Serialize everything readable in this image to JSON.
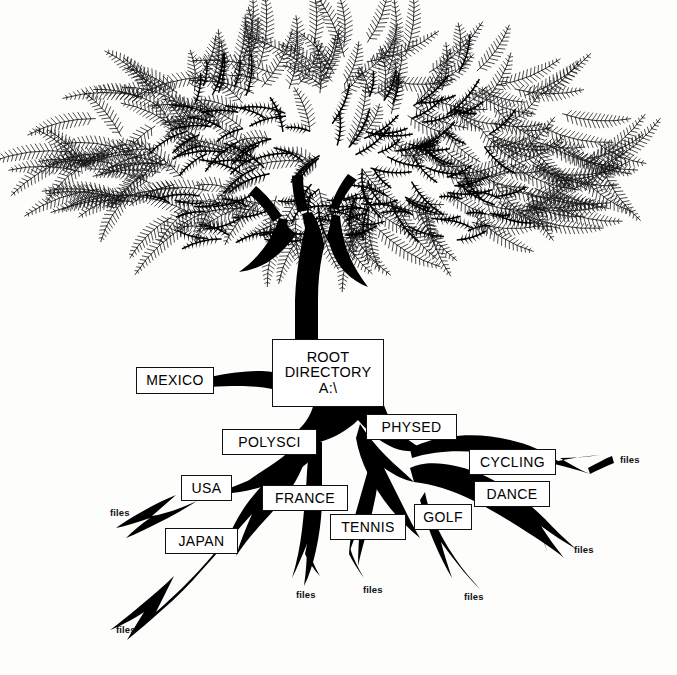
{
  "illustration": {
    "kind": "tree-directory-diagram",
    "caption_style": "pen-and-ink botanical tree with labelled root system",
    "ink_color": "#000000",
    "background_color": "#fdfdfc",
    "box_fill": "#ffffff",
    "box_border": "#111111"
  },
  "root_node": {
    "line1": "ROOT",
    "line2": "DIRECTORY",
    "line3": "A:\\"
  },
  "directories": [
    {
      "label": "MEXICO",
      "x": 136,
      "y": 367,
      "w": 76,
      "h": 25
    },
    {
      "label": "POLYSCI",
      "x": 222,
      "y": 429,
      "w": 93,
      "h": 24
    },
    {
      "label": "PHYSED",
      "x": 366,
      "y": 414,
      "w": 89,
      "h": 24
    },
    {
      "label": "USA",
      "x": 181,
      "y": 475,
      "w": 49,
      "h": 24
    },
    {
      "label": "FRANCE",
      "x": 262,
      "y": 485,
      "w": 84,
      "h": 24
    },
    {
      "label": "CYCLING",
      "x": 469,
      "y": 449,
      "w": 85,
      "h": 24
    },
    {
      "label": "DANCE",
      "x": 474,
      "y": 481,
      "w": 74,
      "h": 24
    },
    {
      "label": "GOLF",
      "x": 414,
      "y": 504,
      "w": 56,
      "h": 24
    },
    {
      "label": "TENNIS",
      "x": 330,
      "y": 514,
      "w": 74,
      "h": 24
    },
    {
      "label": "JAPAN",
      "x": 165,
      "y": 528,
      "w": 71,
      "h": 24
    }
  ],
  "file_labels": [
    {
      "text": "files",
      "x": 110,
      "y": 507
    },
    {
      "text": "files",
      "x": 116,
      "y": 624
    },
    {
      "text": "files",
      "x": 296,
      "y": 589
    },
    {
      "text": "files",
      "x": 363,
      "y": 584
    },
    {
      "text": "files",
      "x": 464,
      "y": 591
    },
    {
      "text": "files",
      "x": 574,
      "y": 544
    },
    {
      "text": "files",
      "x": 620,
      "y": 454
    }
  ]
}
